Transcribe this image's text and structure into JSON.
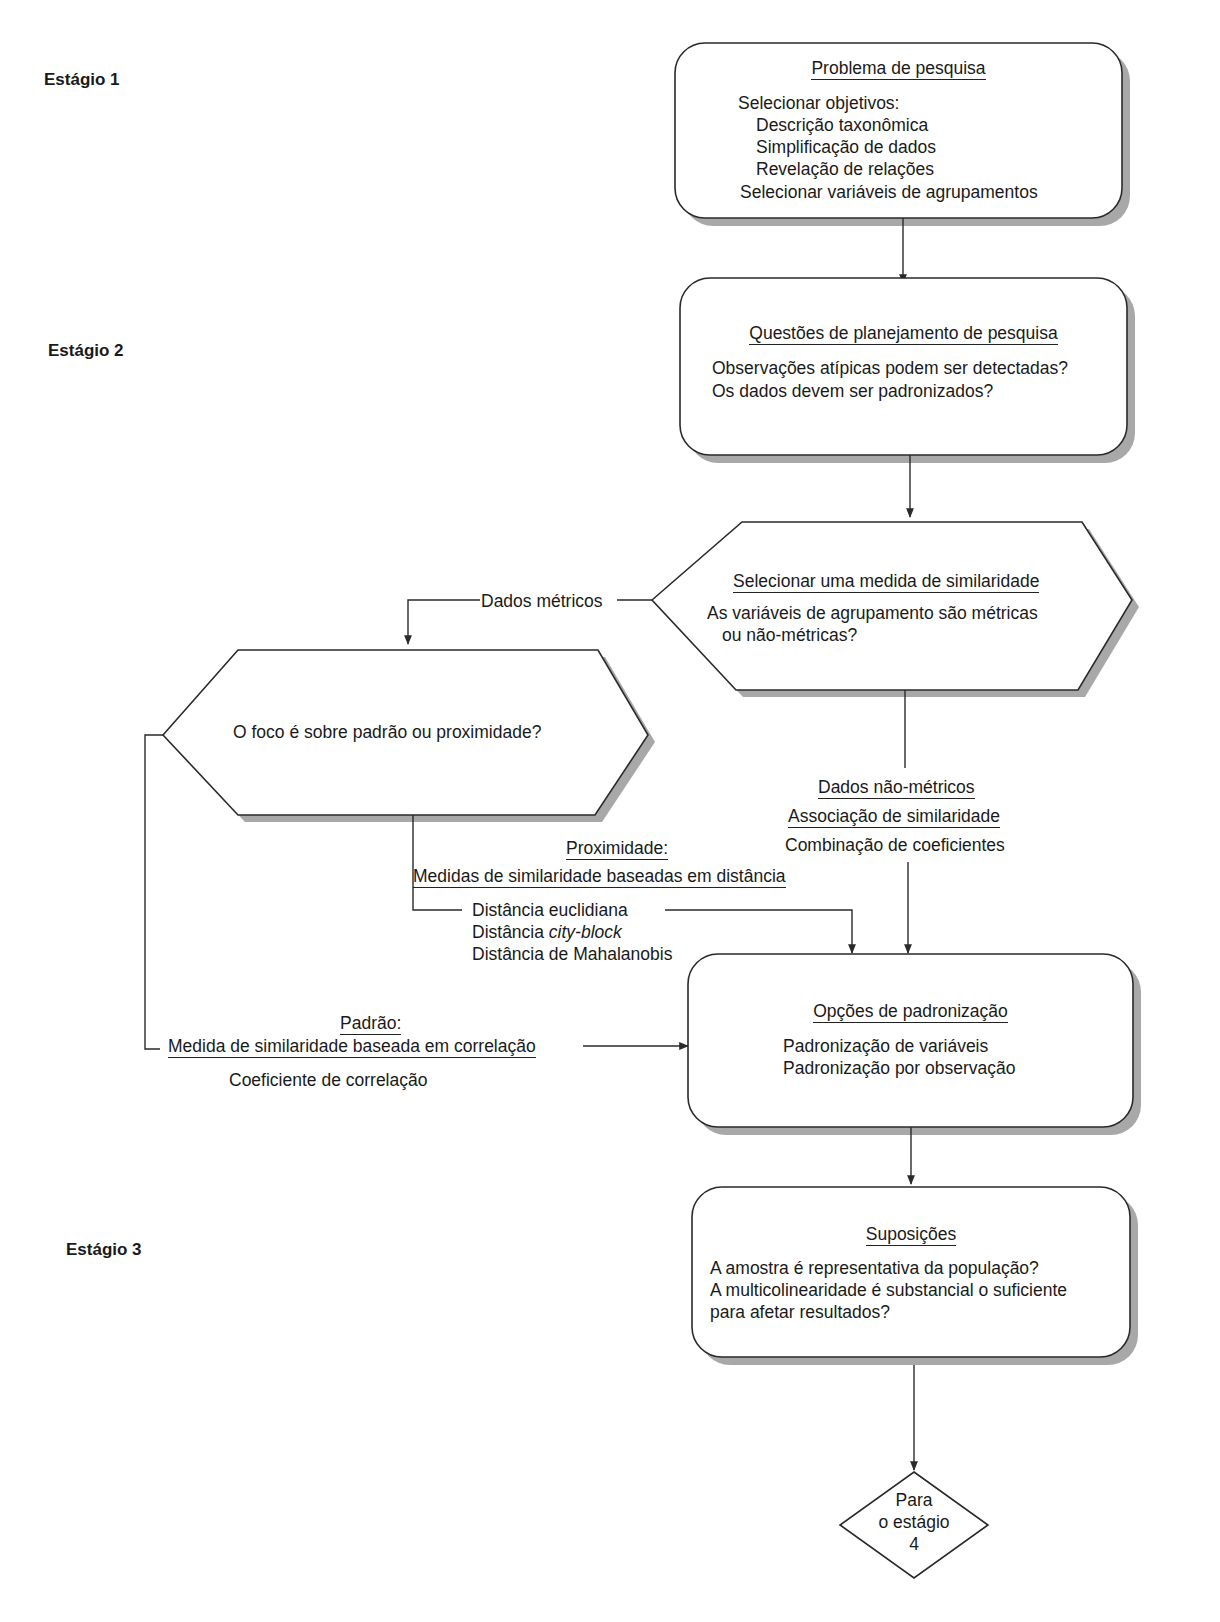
{
  "stages": [
    {
      "label": "Estágio 1"
    },
    {
      "label": "Estágio 2"
    },
    {
      "label": "Estágio 3"
    }
  ],
  "box_problema": {
    "title": "Problema de pesquisa",
    "intro": "Selecionar objetivos:",
    "items": [
      "Descrição taxonômica",
      "Simplificação de dados",
      "Revelação de relações"
    ],
    "footer": "Selecionar variáveis de agrupamentos"
  },
  "box_questoes": {
    "title": "Questões de planejamento de pesquisa",
    "lines": [
      "Observações atípicas podem ser detectadas?",
      "Os dados devem ser padronizados?"
    ]
  },
  "hex_similaridade": {
    "title": "Selecionar uma medida de similaridade",
    "lines": [
      "As variáveis de agrupamento são métricas",
      "ou não-métricas?"
    ]
  },
  "edge_metricos": "Dados métricos",
  "hex_foco": {
    "text": "O foco é sobre padrão ou proximidade?"
  },
  "nao_metricos": {
    "title": "Dados não-métricos",
    "sub": "Associação de similaridade",
    "line": "Combinação de coeficientes"
  },
  "proximidade": {
    "title": "Proximidade:",
    "sub": "Medidas de similaridade baseadas em distância",
    "items": [
      "Distância euclidiana",
      "Distância ",
      "city-block",
      "Distância de Mahalanobis"
    ]
  },
  "padrao": {
    "title": "Padrão:",
    "sub": "Medida de similaridade baseada em correlação",
    "line": "Coeficiente de correlação"
  },
  "box_padronizacao": {
    "title": "Opções de padronização",
    "lines": [
      "Padronização de variáveis",
      "Padronização por observação"
    ]
  },
  "box_suposicoes": {
    "title": "Suposições",
    "lines": [
      "A amostra é representativa da população?",
      "A multicolinearidade é substancial o suficiente",
      "para afetar resultados?"
    ]
  },
  "diamond_next": {
    "lines": [
      "Para",
      "o estágio",
      "4"
    ]
  },
  "colors": {
    "line": "#2a2a2a",
    "shadow": "#9a9a9a",
    "background": "#ffffff"
  }
}
